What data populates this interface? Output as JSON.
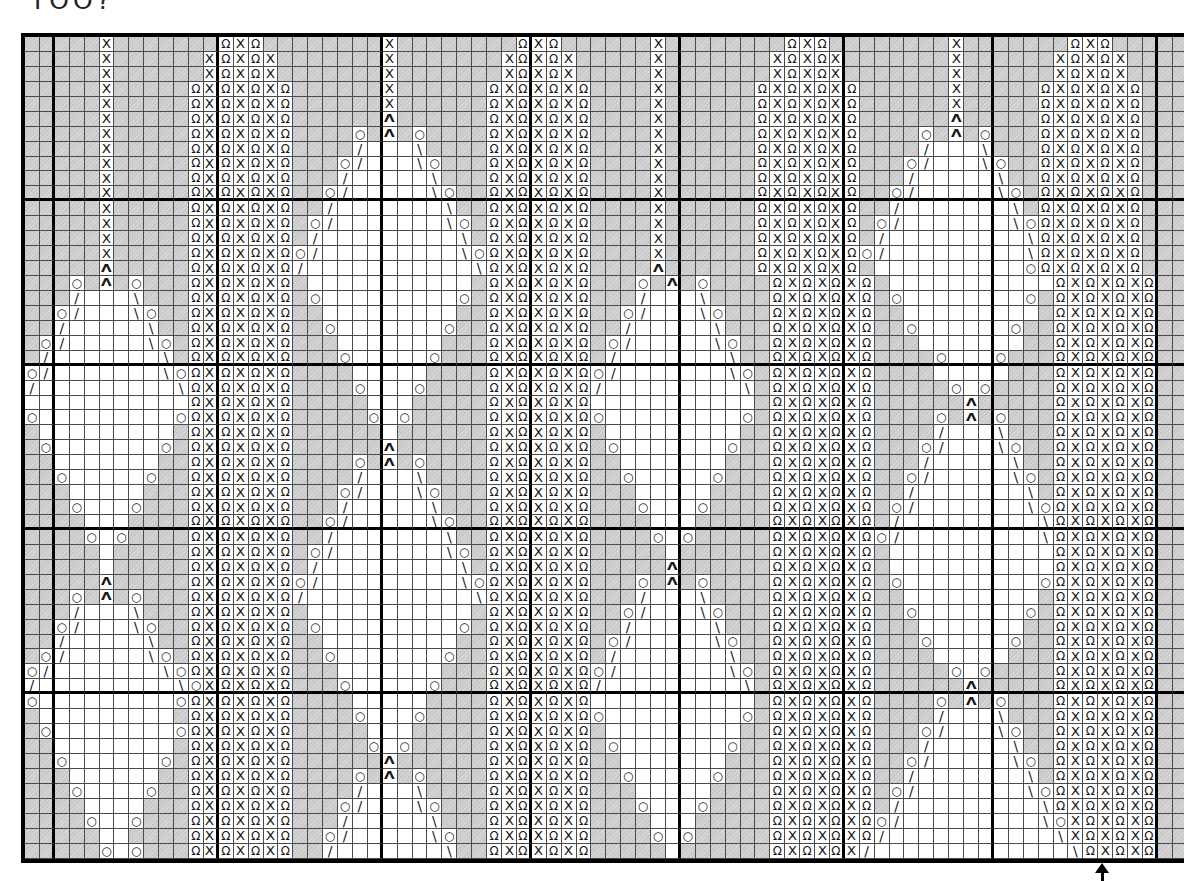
{
  "page": {
    "cropped_text": "TOO?"
  },
  "chart": {
    "columns": 78,
    "rows": 55,
    "cell_w": 14.91,
    "cell_h": 14.945,
    "origin_x": 21,
    "origin_y": 33,
    "colors": {
      "gray": "#c9c9c9",
      "white": "#ffffff",
      "thin_line": "#4a4a4a",
      "heavy_line": "#000000",
      "symbol": "#161616"
    },
    "heavy_col_after": [
      2,
      13,
      24,
      34,
      44,
      55,
      65,
      76
    ],
    "heavy_row_after": [
      11,
      22,
      33,
      44
    ],
    "symbol_glyphs": {
      "X": "X",
      "R": "Ω",
      "A": "Λ",
      "O": "○",
      "/": "/",
      "\\": "\\",
      ".": "",
      "-": ""
    },
    "rows_data": [
      ".....X.......RXR........X........RXR......X........RXR........X.......RXR....",
      ".....X......XRXRX.......X.......XRXRX.....X.......XRXRX.......X......XRXRX...",
      ".....X......XRXRX.......X.......XRXRX.....X.......XRXRX.......X......XRXRX...",
      ".....X.....RXRXRXR......X......RXRXRXR....X......RXRXRXR......X.....RXRXRXR..",
      ".....X.....RXRXRXR......X......RXRXRXR....X......RXRXRXR......X.....RXRXRXR..",
      ".....X.....RXRXRXR......A......RXRXRXR....X......RXRXRXR......A.....RXRXRXR..",
      ".....X.....RXRXRXR....O.A.O....RXRXRXR....X......RXRXRXR....O.A.O...RXRXRXR..",
      ".....X.....RXRXRXR..../---\\....RXRXRXR....X......RXRXRXR..../---\\...RXRXRXR..",
      ".....X.....RXRXRXR...O/---\\O...RXRXRXR....X......RXRXRXR...O/---\\O..RXRXRXR..",
      ".....X.....RXRXRXR.../-----\\...RXRXRXR....X......RXRXRXR.../-----\\..RXRXRXR..",
      ".....X.....RXRXRXR..O/-----\\O..RXRXRXR....X......RXRXRXR..O/-----\\O.RXRXRXR..",
      ".....X.....RXRXRXR../-------\\..RXRXRXR....X......RXRXRXR../-------\\.RXRXRXR..",
      ".....X.....RXRXRXR.O/-------\\O.RXRXRXR....X......RXRXRXR.O/-------\\ORXRXRXR..",
      ".....X.....RXRXRXR./---------\\.RXRXRXR....X......RXRXRXR./---------\\RXRXRXR..",
      ".....X.....RXRXRXRO/---------\\ORXRXRXR....X......RXRXRXRO/---------\\RXRXRXR..",
      ".....A.....RXRXRXR/-----------\\RXRXRXR....A......RXRXRXR.----------ORXRXRXR..",
      "...O.A.O...RXRXRXR.-----------.RXRXRXR...O.A.O....RXRXRXR.-----------RXRXRXR..",
      ".../---\\...RXRXRXR.O---------O.RXRXRXR.../---\\....RXRXRXR.O--------O.RXRXRXR..",
      "..O/---\\O..RXRXRXR..---------..RXRXRXR..O/---\\O...RXRXRXR..---------.RXRXRXR..",
      "../-----\\..RXRXRXR..O-------O..RXRXRXR../-----\\...RXRXRXR..O------O..RXRXRXR..",
      ".O/-----\\O.RXRXRXR...-------...RXRXRXR.O/-----\\O..RXRXRXR...-------..RXRXRXR..",
      "./-------\\.RXRXRXR...O-----O...RXRXRXR./-------\\..RXRXRXR....O---O...RXRXRXR..",
      "O/-------\\ORXRXRXR....-----....RXRXRXRO/-------\\O.RXRXRXR....-----...RXRXRXR..",
      "/---------\\RXRXRXR....O---O....RXRXRXR/---------\\.RXRXRXR.....O-O....RXRXRXR..",
      "-----------RXRXRXR.....---.....RXRXRXR-----------.RXRXRXR......A.....RXRXRXR..",
      "O---------ORXRXRXR.....O-O.....RXRXRXRO---------O.RXRXRXR....O.A.O...RXRXRXR..",
      ".---------.RXRXRXR......-......RXRXRXR.---------..RXRXRXR..../---\\...RXRXRXR..",
      ".O-------O.RXRXRXR......A......RXRXRXR.O-------O..RXRXRXR...O/---\\O..RXRXRXR..",
      "..-------..RXRXRXR....O.A.O....RXRXRXR..-------...RXRXRXR.../-----\\..RXRXRXR..",
      "..O-----O..RXRXRXR..../---\\....RXRXRXR..O-----O...RXRXRXR..O/-----\\O.RXRXRXR..",
      "...-----...RXRXRXR...O/---\\O...RXRXRXR...-----....RXRXRXR../-------\\.RXRXRXR..",
      "...O---O...RXRXRXR.../-----\\...RXRXRXR...O---O....RXRXRXR.O/-------\\ORXRXRXR..",
      "....---....RXRXRXR..O/-----\\O..RXRXRXR....---.....RXRXRXR./---------\\RXRXRXR..",
      "....O-O....RXRXRXR../-------\\..RXRXRXR....O-O.....RXRXRXRO/---------\\RXRXRXR..",
      ".....-.....RXRXRXR.O/-------\\O.RXRXRXR.....-......RXRXRXR.-----------RXRXRXR..",
      ".....-.....RXRXRXR./---------\\.RXRXRXR.....A......RXRXRXR.-----------RXRXRXR..",
      ".....A.....RXRXRXRO/---------\\ORXRXRXR...O.A.O....RXRXRXR.O---------ORXRXRXR..",
      "...O.A.O...RXRXRXR/-----------\\RXRXRXR.../---\\....RXRXRXR..---------.RXRXRXR..",
      ".../---\\...RXRXRXR.-----------.RXRXRXR..O/---\\O...RXRXRXR..O-------O.RXRXRXR..",
      "..O/---\\O..RXRXRXR.O---------O.RXRXRXR../-----\\...RXRXRXR...-------..RXRXRXR..",
      "../-----\\..RXRXRXR..---------..RXRXRXR.O/-----\\O..RXRXRXR...O-----O..RXRXRXR..",
      ".O/-----\\O.RXRXRXR..O-------O..RXRXRXR./-------\\..RXRXRXR....-----...RXRXRXR..",
      "O/-------\\ORXRXRXR...-------...RXRXRXRO/-------\\O.RXRXRXR.....O-O....RXRXRXR..",
      "/---------\\OXRXRXR...O-----O...RXRXRXR/---------\\.RXRXRXR......A.....RXRXRXR..",
      "O---------ORXRXRXR....-----....RXRXRXR-----------.RXRXRXR....O.A.O...RXRXRXR..",
      ".---------.RXRXRXR....O---O....RXRXRXRO---------O.RXRXRXR..../---\\...RXRXRXR..",
      ".O--------ORXRXRXR.....---.....RXRXRXR.---------..RXRXRXR...O/---\\O..RXRXRXR..",
      "..--------.RXRXRXR.....O-O.....RXRXRXR.O-------O..RXRXRXR.../-----\\..RXRXRXR..",
      "..O------O.RXRXRXR......A......RXRXRXR..-------...RXRXRXR..O/-----\\O.RXRXRXR..",
      "...------..RXRXRXR....O.A.O....RXRXRXR..O-----O...RXRXRXR../-------\\.RXRXRXR..",
      "...O----O..RXRXRXR..../---\\....RXRXRXR...-----....RXRXRXR.O/-------\\ORXRXRXR..",
      "....----...RXRXRXR...O/---\\O...RXRXRXR...O---O....RXRXRXR./---------\\RXRXRXR..",
      "....O--O...RXRXRXR.../-----\\...RXRXRXR....---.....RXRXRXRO/---------\\OXRXRXR..",
      ".....--....RXRXRXR..O/-----\\O..RXRXRXR....O-O.....RXRXRXR/-----------\\XRXRXR..",
      ".....O-O...RXRXRXR../-------\\..RXRXRXR.....-......RXRXRX/-------------\\RXRXR.."
    ]
  },
  "arrow": {
    "column": 72,
    "meaning": "marked stitch column below chart"
  }
}
